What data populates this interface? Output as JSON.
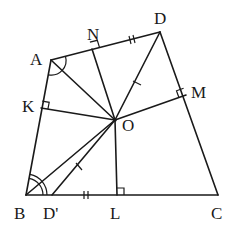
{
  "diagram": {
    "type": "geometry",
    "points": {
      "A": {
        "x": 51,
        "y": 60,
        "label": "A",
        "lx": 30,
        "ly": 65
      },
      "B": {
        "x": 26,
        "y": 195,
        "label": "B",
        "lx": 14,
        "ly": 219
      },
      "C": {
        "x": 218,
        "y": 195,
        "label": "C",
        "lx": 213,
        "ly": 219
      },
      "D": {
        "x": 160,
        "y": 32,
        "label": "D",
        "lx": 154,
        "ly": 24
      },
      "O": {
        "x": 115,
        "y": 120,
        "label": "O",
        "lx": 122,
        "ly": 131
      },
      "N": {
        "x": 92,
        "y": 49,
        "label": "N",
        "lx": 87,
        "ly": 40
      },
      "K": {
        "x": 41,
        "y": 108,
        "label": "K",
        "lx": 22,
        "ly": 112
      },
      "M": {
        "x": 186,
        "y": 95,
        "label": "M",
        "lx": 192,
        "ly": 98
      },
      "L": {
        "x": 117,
        "y": 195,
        "label": "L",
        "lx": 110,
        "ly": 219
      },
      "D'": {
        "x": 52,
        "y": 195,
        "label": "D'",
        "lx": 41,
        "ly": 219
      }
    },
    "segments": [
      [
        "A",
        "B"
      ],
      [
        "B",
        "C"
      ],
      [
        "C",
        "D"
      ],
      [
        "D",
        "A"
      ],
      [
        "O",
        "A"
      ],
      [
        "O",
        "B"
      ],
      [
        "O",
        "D"
      ],
      [
        "O",
        "N"
      ],
      [
        "O",
        "K"
      ],
      [
        "O",
        "M"
      ],
      [
        "O",
        "L"
      ],
      [
        "O",
        "D'"
      ]
    ],
    "right_angles": [
      "N",
      "K",
      "M",
      "L"
    ],
    "equal_marks": {
      "double_tick": [
        "ND",
        "D'L"
      ],
      "single_tick": [
        "OD",
        "OD'"
      ]
    },
    "angle_marks": {
      "A": "single arc (OA bisects angle A)",
      "B": "double arc (OB bisects angle B)"
    },
    "colors": {
      "stroke": "#1a1a1a",
      "background": "#ffffff"
    }
  }
}
